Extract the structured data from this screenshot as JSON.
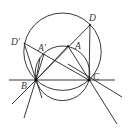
{
  "diagram": {
    "type": "geometry-construction",
    "points": {
      "B": {
        "label": "B",
        "x": 36,
        "y": 80
      },
      "C": {
        "label": "C",
        "x": 89,
        "y": 80
      },
      "D": {
        "label": "D",
        "x": 90,
        "y": 25
      },
      "A": {
        "label": "A",
        "x": 68,
        "y": 46
      },
      "A_prime": {
        "label": "A′",
        "x": 44,
        "y": 54
      },
      "D_prime": {
        "label": "D′",
        "x": 24,
        "y": 43
      }
    },
    "circles": [
      {
        "name": "large-circle",
        "cx": 62.5,
        "cy": 51.7,
        "r": 38.7
      },
      {
        "name": "small-circle",
        "cx": 62.5,
        "cy": 73.3,
        "r": 27.3
      }
    ],
    "labels": {
      "B": "B",
      "C": "C",
      "D": "D",
      "A": "A",
      "A_prime": "A′",
      "D_prime": "D′"
    },
    "colors": {
      "stroke": "#222222",
      "background": "#ffffff"
    }
  }
}
